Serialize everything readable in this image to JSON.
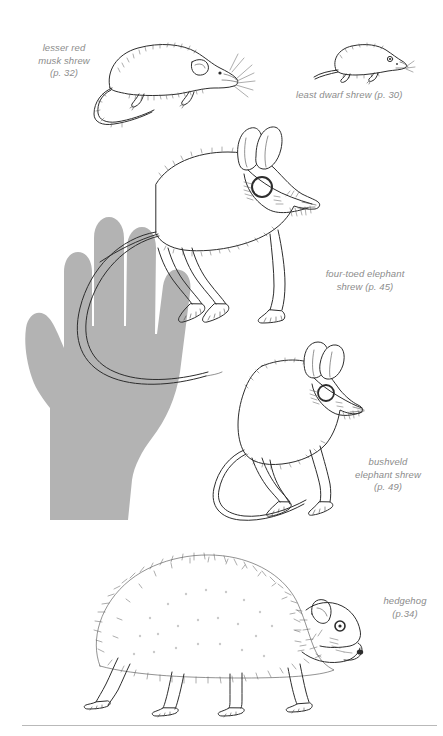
{
  "page": {
    "background_color": "#ffffff",
    "width": 443,
    "height": 736
  },
  "palette": {
    "caption_text": "#8c8c8c",
    "hand_silhouette": "#b3b3b3",
    "ink": "#2d2d2d",
    "ink_light": "#5a5a5a",
    "rule": "#b9b9b9"
  },
  "captions": {
    "lesser_red_musk_shrew": "lesser red\nmusk shrew\n(p. 32)",
    "least_dwarf_shrew": "least dwarf shrew (p. 30)",
    "four_toed_elephant_shrew": "four-toed elephant\nshrew (p. 45)",
    "bushveld_elephant_shrew": "bushveld\nelephant shrew\n(p. 49)",
    "hedgehog": "hedgehog\n(p.34)"
  },
  "figures": [
    {
      "name": "lesser-red-musk-shrew",
      "species": "lesser red musk shrew",
      "page_ref": "p. 32"
    },
    {
      "name": "least-dwarf-shrew",
      "species": "least dwarf shrew",
      "page_ref": "p. 30"
    },
    {
      "name": "four-toed-elephant-shrew",
      "species": "four-toed elephant shrew",
      "page_ref": "p. 45"
    },
    {
      "name": "bushveld-elephant-shrew",
      "species": "bushveld elephant shrew",
      "page_ref": "p. 49"
    },
    {
      "name": "hedgehog",
      "species": "hedgehog",
      "page_ref": "p.34"
    }
  ],
  "scale_reference": {
    "name": "human-hand-silhouette",
    "description": "open human hand, palm up, grey silhouette used for size comparison"
  },
  "divider": {
    "name": "bottom-rule"
  }
}
